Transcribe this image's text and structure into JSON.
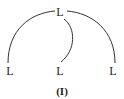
{
  "diagram": {
    "nodes": {
      "top": {
        "label": "L"
      },
      "bottom_left": {
        "label": "L"
      },
      "bottom_middle": {
        "label": "L"
      },
      "bottom_right": {
        "label": "L"
      }
    },
    "edges": [
      {
        "from": "top",
        "to": "bottom_left"
      },
      {
        "from": "top",
        "to": "bottom_middle"
      },
      {
        "from": "top",
        "to": "bottom_right"
      }
    ],
    "caption": "(I)",
    "colors": {
      "line": "#333333",
      "text": "#222222",
      "background": "#ffffff"
    }
  }
}
